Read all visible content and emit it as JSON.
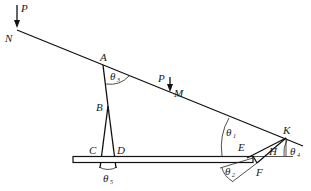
{
  "diagram": {
    "type": "mechanism-linkage",
    "points": {
      "N": {
        "label": "N"
      },
      "A": {
        "label": "A"
      },
      "B": {
        "label": "B"
      },
      "C": {
        "label": "C"
      },
      "D": {
        "label": "D"
      },
      "M": {
        "label": "M"
      },
      "K": {
        "label": "K"
      },
      "E": {
        "label": "E"
      },
      "F": {
        "label": "F"
      },
      "H": {
        "label": "H"
      }
    },
    "forces": [
      {
        "label": "P",
        "at": "N",
        "direction": "down"
      },
      {
        "label": "P",
        "at": "M",
        "direction": "down"
      }
    ],
    "angles": [
      {
        "symbol": "θ",
        "subscript": "3",
        "at": "A"
      },
      {
        "symbol": "θ",
        "subscript": "5",
        "at": "C-D"
      },
      {
        "symbol": "θ",
        "subscript": "1",
        "at": "E-side"
      },
      {
        "symbol": "θ",
        "subscript": "4",
        "at": "K"
      },
      {
        "symbol": "θ",
        "subscript": "2",
        "at": "F"
      }
    ]
  }
}
